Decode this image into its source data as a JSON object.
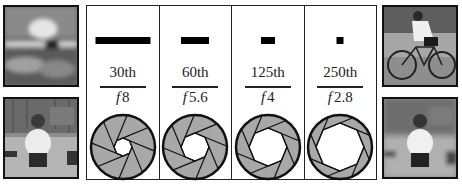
{
  "photos": {
    "top_left": {
      "description": "blurred cyclist (motion blur)"
    },
    "bottom_left": {
      "description": "man crouching, sharp subject, background detailed"
    },
    "top_right": {
      "description": "cyclist frozen sharp"
    },
    "bottom_right": {
      "description": "man crouching, subject sharp, background blurred"
    }
  },
  "columns": [
    {
      "speed": "30th",
      "fstop": "8",
      "bar_width": 55,
      "aperture_radius": 9
    },
    {
      "speed": "60th",
      "fstop": "5.6",
      "bar_width": 28,
      "aperture_radius": 14
    },
    {
      "speed": "125th",
      "fstop": "4",
      "bar_width": 14,
      "aperture_radius": 19
    },
    {
      "speed": "250th",
      "fstop": "2.8",
      "bar_width": 7,
      "aperture_radius": 24
    }
  ],
  "f_prefix": "f",
  "colors": {
    "blade_fill": "#a8a8a8",
    "outline": "#111111",
    "bar": "#000000"
  }
}
